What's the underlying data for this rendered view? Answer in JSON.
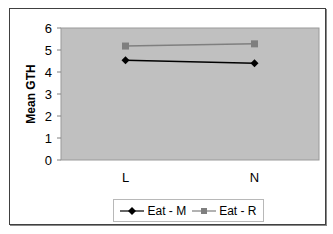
{
  "chart_data": {
    "type": "line",
    "title": "",
    "xlabel": "",
    "ylabel": "Mean GTH",
    "categories": [
      "L",
      "N"
    ],
    "series": [
      {
        "name": "Eat - M",
        "values": [
          4.53,
          4.4
        ],
        "color": "#000000",
        "marker": "diamond"
      },
      {
        "name": "Eat - R",
        "values": [
          5.18,
          5.28
        ],
        "color": "#7f7f7f",
        "marker": "square"
      }
    ],
    "ylim": [
      0,
      6
    ],
    "yticks": [
      0,
      1,
      2,
      3,
      4,
      5,
      6
    ],
    "grid": false,
    "legend_position": "bottom",
    "plot_background": "#c0c0c0"
  }
}
